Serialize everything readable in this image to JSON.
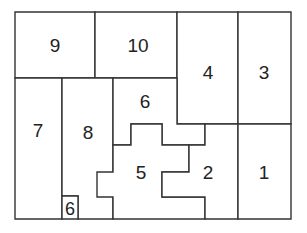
{
  "diagram": {
    "type": "sliding-block-puzzle",
    "frame": {
      "x": 15,
      "y": 12,
      "width": 276,
      "height": 207
    },
    "stroke_color": "#333333",
    "background_color": "#ffffff",
    "pieces": [
      {
        "id": "piece-9",
        "label": "9",
        "points": "15,12 95,12 95,78 15,78",
        "label_x": 55,
        "label_y": 45
      },
      {
        "id": "piece-10",
        "label": "10",
        "points": "95,12 177,12 177,78 95,78",
        "label_x": 138,
        "label_y": 45
      },
      {
        "id": "piece-4",
        "label": "4",
        "points": "177,12 238,12 238,124 177,124",
        "label_x": 208,
        "label_y": 72
      },
      {
        "id": "piece-3",
        "label": "3",
        "points": "238,12 291,12 291,124 238,124",
        "label_x": 264,
        "label_y": 72
      },
      {
        "id": "piece-7",
        "label": "7",
        "points": "15,78 62,78 62,219 15,219",
        "label_x": 38,
        "label_y": 130
      },
      {
        "id": "piece-8",
        "label": "8",
        "points": "62,78 113,78 113,219 78,219 78,196 62,196",
        "label_x": 88,
        "label_y": 132
      },
      {
        "id": "piece-6-large",
        "label": "6",
        "points": "113,78 177,78 177,124 205,124 205,145 162,145 162,124 131,124 131,145 113,145",
        "label_x": 145,
        "label_y": 101
      },
      {
        "id": "piece-5",
        "label": "5",
        "points": "113,145 131,145 131,124 162,124 162,145 189,145 189,172 162,172 162,197 205,197 205,219 113,219 113,197 97,197 97,172 113,172",
        "label_x": 141,
        "label_y": 172
      },
      {
        "id": "piece-2",
        "label": "2",
        "points": "189,145 205,145 205,124 238,124 238,219 205,219 205,197 162,197 162,172 189,172",
        "label_x": 208,
        "label_y": 172
      },
      {
        "id": "piece-1",
        "label": "1",
        "points": "238,124 291,124 291,219 238,219",
        "label_x": 264,
        "label_y": 172
      },
      {
        "id": "piece-6-small",
        "label": "6",
        "points": "62,196 78,196 78,219 62,219",
        "label_x": 70,
        "label_y": 209,
        "small": true
      }
    ]
  }
}
